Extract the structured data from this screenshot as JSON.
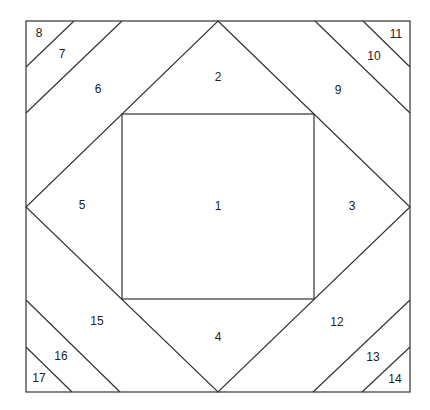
{
  "diagram": {
    "line_color": "#333333",
    "labels": [
      {
        "id": "1",
        "text": "1",
        "x": 218,
        "y": 207
      },
      {
        "id": "2",
        "text": "2",
        "x": 218,
        "y": 78
      },
      {
        "id": "3",
        "text": "3",
        "x": 352,
        "y": 207
      },
      {
        "id": "4",
        "text": "4",
        "x": 218,
        "y": 338
      },
      {
        "id": "5",
        "text": "5",
        "x": 82,
        "y": 206
      },
      {
        "id": "6",
        "text": "6",
        "x": 98,
        "y": 90
      },
      {
        "id": "7",
        "text": "7",
        "x": 62,
        "y": 55
      },
      {
        "id": "8",
        "text": "8",
        "x": 39,
        "y": 34
      },
      {
        "id": "9",
        "text": "9",
        "x": 338,
        "y": 91
      },
      {
        "id": "10",
        "text": "10",
        "x": 374,
        "y": 57
      },
      {
        "id": "11",
        "text": "11",
        "x": 396,
        "y": 35
      },
      {
        "id": "12",
        "text": "12",
        "x": 337,
        "y": 323
      },
      {
        "id": "13",
        "text": "13",
        "x": 373,
        "y": 358
      },
      {
        "id": "14",
        "text": "14",
        "x": 395,
        "y": 380
      },
      {
        "id": "15",
        "text": "15",
        "x": 97,
        "y": 322
      },
      {
        "id": "16",
        "text": "16",
        "x": 61,
        "y": 357
      },
      {
        "id": "17",
        "text": "17",
        "x": 39,
        "y": 379
      }
    ]
  }
}
